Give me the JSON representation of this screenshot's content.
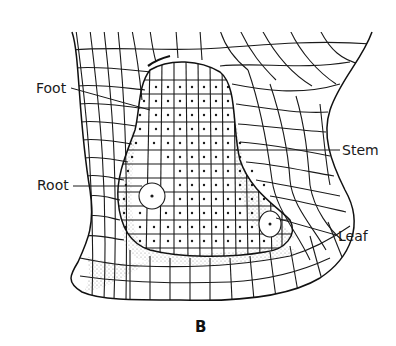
{
  "figure": {
    "panel_label": "B",
    "labels": {
      "foot": "Foot",
      "stem": "Stem",
      "root": "Root",
      "leaf": "Leaf"
    },
    "colors": {
      "ink": "#1a1a1a",
      "background": "#ffffff",
      "stipple": "#555555"
    }
  }
}
